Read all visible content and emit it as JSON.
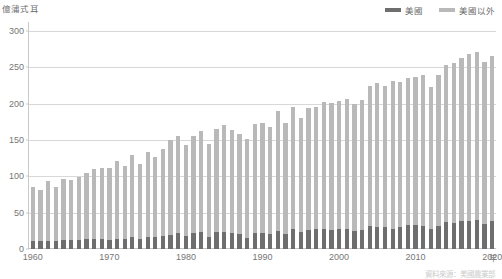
{
  "axis": {
    "y_unit_label": "億蒲式耳",
    "x_unit_label": "年",
    "y_ticks": [
      0,
      50,
      100,
      150,
      200,
      250,
      300
    ],
    "x_ticks": [
      1960,
      1970,
      1980,
      1990,
      2000,
      2010,
      2020
    ]
  },
  "legend": {
    "items": [
      {
        "label": "美國",
        "color": "#6e6e6e"
      },
      {
        "label": "美國以外",
        "color": "#b9b9b9"
      }
    ]
  },
  "source_note": "資料來源：美國農業部",
  "chart_data": {
    "type": "bar",
    "title": "",
    "subtitle": "",
    "xlabel": "年",
    "ylabel": "億蒲式耳",
    "ylim": [
      0,
      300
    ],
    "xlim": [
      1960,
      2020
    ],
    "grid": true,
    "stacked": true,
    "legend_position": "top-right",
    "colors": {
      "美國": "#6e6e6e",
      "美國以外": "#b9b9b9"
    },
    "categories": [
      1960,
      1961,
      1962,
      1963,
      1964,
      1965,
      1966,
      1967,
      1968,
      1969,
      1970,
      1971,
      1972,
      1973,
      1974,
      1975,
      1976,
      1977,
      1978,
      1979,
      1980,
      1981,
      1982,
      1983,
      1984,
      1985,
      1986,
      1987,
      1988,
      1989,
      1990,
      1991,
      1992,
      1993,
      1994,
      1995,
      1996,
      1997,
      1998,
      1999,
      2000,
      2001,
      2002,
      2003,
      2004,
      2005,
      2006,
      2007,
      2008,
      2009,
      2010,
      2011,
      2012,
      2013,
      2014,
      2015,
      2016,
      2017,
      2018,
      2019,
      2020
    ],
    "series": [
      {
        "name": "美國",
        "values": [
          11,
          11,
          11,
          11,
          12,
          12,
          13,
          14,
          14,
          14,
          13,
          14,
          14,
          16,
          14,
          16,
          16,
          18,
          19,
          22,
          18,
          22,
          23,
          16,
          23,
          23,
          22,
          21,
          15,
          22,
          22,
          21,
          25,
          21,
          28,
          24,
          26,
          27,
          27,
          26,
          28,
          27,
          25,
          26,
          31,
          30,
          30,
          28,
          30,
          33,
          33,
          32,
          28,
          31,
          37,
          36,
          39,
          39,
          40,
          35,
          38
        ]
      },
      {
        "name": "美國以外",
        "values": [
          74,
          70,
          82,
          74,
          85,
          83,
          86,
          90,
          96,
          98,
          98,
          107,
          100,
          114,
          103,
          118,
          110,
          120,
          131,
          134,
          125,
          134,
          139,
          128,
          142,
          147,
          142,
          137,
          136,
          150,
          151,
          147,
          165,
          153,
          167,
          156,
          168,
          169,
          175,
          175,
          176,
          180,
          175,
          179,
          194,
          198,
          195,
          203,
          200,
          202,
          204,
          207,
          195,
          209,
          216,
          220,
          224,
          230,
          231,
          222,
          228
        ]
      }
    ]
  }
}
